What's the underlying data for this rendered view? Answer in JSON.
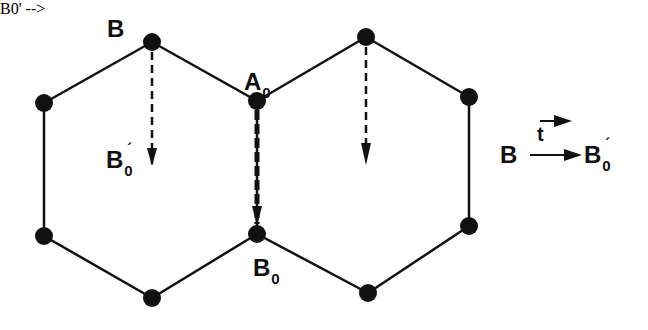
{
  "diagram": {
    "type": "lattice-translation",
    "colors": {
      "line": "#111111",
      "node": "#111111",
      "background": "#ffffff"
    },
    "nodes": [
      {
        "id": "B",
        "x": 152,
        "y": 42
      },
      {
        "id": "left-top",
        "x": 44,
        "y": 103
      },
      {
        "id": "left-bottom",
        "x": 44,
        "y": 236
      },
      {
        "id": "bottom-left",
        "x": 152,
        "y": 298
      },
      {
        "id": "A0",
        "x": 257,
        "y": 101
      },
      {
        "id": "B0",
        "x": 257,
        "y": 234
      },
      {
        "id": "top-right",
        "x": 366,
        "y": 37
      },
      {
        "id": "right-top",
        "x": 469,
        "y": 97
      },
      {
        "id": "right-bottom",
        "x": 469,
        "y": 226
      },
      {
        "id": "bottom-right",
        "x": 368,
        "y": 293
      }
    ],
    "labels": {
      "B": {
        "main": "B",
        "sub": "",
        "prime": ""
      },
      "A0": {
        "main": "A",
        "sub": "0",
        "prime": ""
      },
      "B0prime": {
        "main": "B",
        "sub": "0",
        "prime": "´"
      },
      "B0": {
        "main": "B",
        "sub": "0",
        "prime": ""
      }
    },
    "legend": {
      "from": "B",
      "vector": "t",
      "to_main": "B",
      "to_sub": "0",
      "to_prime": "´"
    }
  }
}
